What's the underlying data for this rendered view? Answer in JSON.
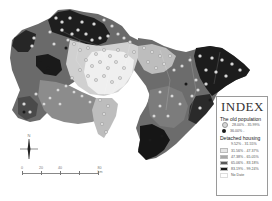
{
  "map": {
    "region_shading": {
      "low": "#f2f2f2",
      "lowmid": "#d6d6d6",
      "mid": "#9c9c9c",
      "midhigh": "#5e5e5e",
      "high": "#1e1e1e",
      "nodata": "#ffffff"
    },
    "dot_colors": {
      "old_low": "#dcdcdc",
      "old_high": "#1a1a1a"
    }
  },
  "legend": {
    "title": "INDEX",
    "old_population": {
      "heading": "The old population",
      "items": [
        {
          "label": "28.00% - 35.99%",
          "symbol": "light-circle",
          "color": "#d8d8d8"
        },
        {
          "label": "36.00% -",
          "symbol": "dark-circle",
          "color": "#1a1a1a"
        }
      ]
    },
    "detached_housing": {
      "heading": "Detached housing",
      "items": [
        {
          "label": "9.52% - 31.55%",
          "color": "#ffffff"
        },
        {
          "label": "31.56% - 47.37%",
          "color": "#e6e6e6"
        },
        {
          "label": "47.38% - 65.05%",
          "color": "#a8a8a8"
        },
        {
          "label": "65.06% - 83.18%",
          "color": "#5a5a5a"
        },
        {
          "label": "83.19% - 99.24%",
          "color": "#1c1c1c"
        },
        {
          "label": "No Date",
          "color": "#ffffff"
        }
      ]
    }
  },
  "scale_bar": {
    "ticks": [
      "0",
      "20",
      "40",
      "80 km"
    ]
  },
  "north_arrow": {
    "label": "N"
  }
}
